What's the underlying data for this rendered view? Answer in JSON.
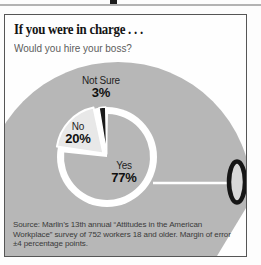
{
  "header": {
    "title": "If you were in charge . . .",
    "subtitle": "Would you hire your boss?"
  },
  "chart_data": {
    "type": "pie",
    "title": "If you were in charge . . .",
    "question": "Would you hire your boss?",
    "direction": "clockwise",
    "start_angle_deg": 0,
    "total": 100,
    "slices": [
      {
        "label": "Yes",
        "value": 77,
        "display": "77%",
        "color": "#b7b7b7"
      },
      {
        "label": "No",
        "value": 20,
        "display": "20%",
        "color": "#e8e8e8"
      },
      {
        "label": "Not Sure",
        "value": 3,
        "display": "3%",
        "color": "#1a1a1a"
      }
    ]
  },
  "source": {
    "text": "Source: Marlin’s 13th annual “Attitudes in the American Workplace” survey of 752 workers 18 and older. Margin of error ±4 percentage points."
  },
  "colors": {
    "mug_body": "#b7b7b7",
    "no_slice": "#e8e8e8",
    "not_sure_slice": "#1a1a1a",
    "handle_ring": "#161616",
    "panel_border": "#565656",
    "subtitle_text": "#5c5c5c",
    "source_text": "#3a3a3a"
  }
}
